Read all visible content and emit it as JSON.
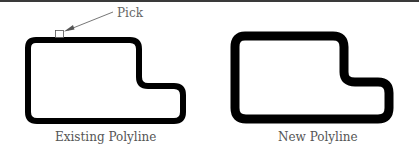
{
  "figure": {
    "annotation": {
      "text": "Pick"
    },
    "panels": [
      {
        "id": "existing",
        "caption": "Existing Polyline"
      },
      {
        "id": "new",
        "caption": "New Polyline"
      }
    ],
    "colors": {
      "stroke": "#000000",
      "caption": "#555555",
      "arrow": "#666666",
      "top_rule": "#3a3a3a"
    }
  }
}
